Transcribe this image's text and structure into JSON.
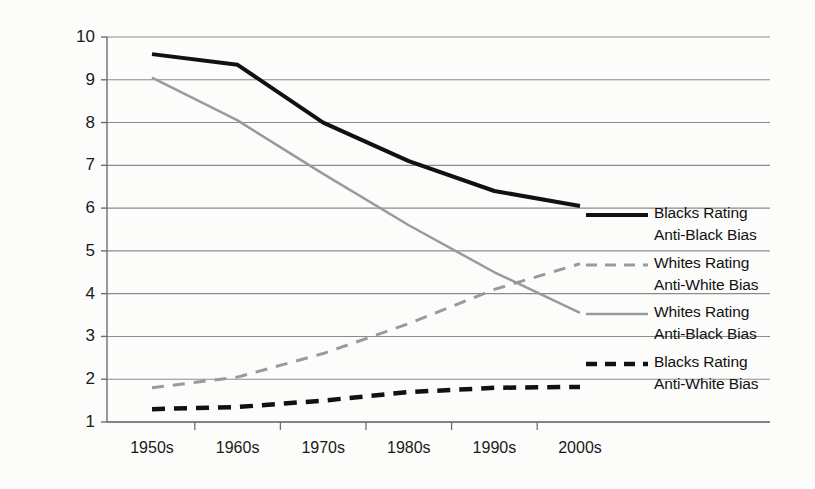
{
  "chart_data": {
    "type": "line",
    "title": "",
    "subtitle": "",
    "xlabel": "",
    "ylabel": "",
    "categories": [
      "1950s",
      "1960s",
      "1970s",
      "1980s",
      "1990s",
      "2000s"
    ],
    "x_tick_labels": [
      "1950s",
      "1960s",
      "1970s",
      "1980s",
      "1990s",
      "2000s"
    ],
    "y_tick_labels": [
      "1",
      "2",
      "3",
      "4",
      "5",
      "6",
      "7",
      "8",
      "9",
      "10"
    ],
    "y_ticks": [
      1,
      2,
      3,
      4,
      5,
      6,
      7,
      8,
      9,
      10
    ],
    "ylim": [
      1,
      10
    ],
    "grid": true,
    "grid_axis": "y",
    "legend_position": "right",
    "series": [
      {
        "name": "Blacks Rating Anti-Black Bias",
        "label_line1": "Blacks Rating",
        "label_line2": "Anti-Black Bias",
        "style": "solid",
        "color": "#111111",
        "width": 4,
        "values": [
          9.6,
          9.35,
          8.0,
          7.1,
          6.4,
          6.05
        ]
      },
      {
        "name": "Whites Rating Anti-White Bias",
        "label_line1": "Whites Rating",
        "label_line2": "Anti-White Bias",
        "style": "dashed",
        "color": "#9a9a9a",
        "width": 3,
        "values": [
          1.8,
          2.05,
          2.6,
          3.3,
          4.1,
          4.7
        ]
      },
      {
        "name": "Whites Rating Anti-Black Bias",
        "label_line1": "Whites Rating",
        "label_line2": "Anti-Black Bias",
        "style": "solid",
        "color": "#9a9a9a",
        "width": 2.5,
        "values": [
          9.05,
          8.05,
          6.8,
          5.6,
          4.5,
          3.55
        ]
      },
      {
        "name": "Blacks Rating Anti-White Bias",
        "label_line1": "Blacks Rating",
        "label_line2": "Anti-White Bias",
        "style": "dashed",
        "color": "#111111",
        "width": 4.5,
        "values": [
          1.3,
          1.35,
          1.5,
          1.7,
          1.8,
          1.82
        ]
      }
    ]
  },
  "colors": {
    "background": "#fcfcfb",
    "gridline": "#8c8c8c",
    "axis": "#6e6e6e",
    "text": "#111111",
    "dark_series": "#111111",
    "light_series": "#9a9a9a"
  }
}
